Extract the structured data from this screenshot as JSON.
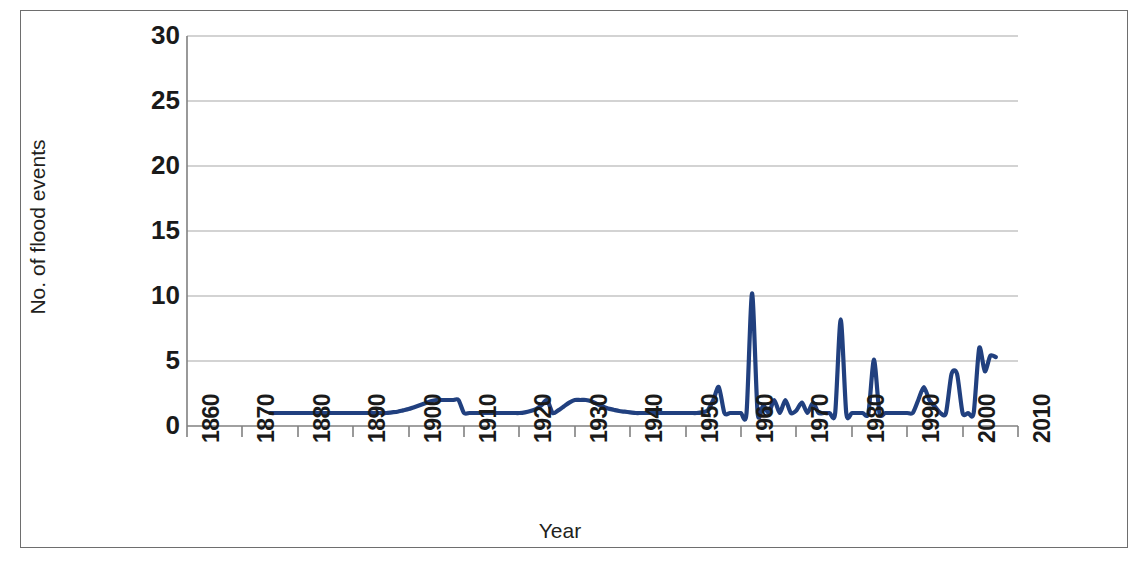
{
  "chart_data": {
    "type": "line",
    "title": "",
    "xlabel": "Year",
    "ylabel": "No. of flood events",
    "xlim": [
      1860,
      2010
    ],
    "ylim": [
      0,
      30
    ],
    "grid": "horizontal",
    "legend": "none",
    "line_color": "#21407f",
    "x_tick_labels": [
      "1860",
      "1870",
      "1880",
      "1890",
      "1900",
      "1910",
      "1920",
      "1930",
      "1940",
      "1950",
      "1960",
      "1970",
      "1980",
      "1990",
      "2000",
      "2010"
    ],
    "y_tick_labels": [
      "0",
      "5",
      "10",
      "15",
      "20",
      "25",
      "30"
    ],
    "series": [
      {
        "name": "No. of flood events",
        "x": [
          1875,
          1876,
          1877,
          1878,
          1879,
          1880,
          1881,
          1882,
          1883,
          1884,
          1885,
          1886,
          1887,
          1888,
          1889,
          1890,
          1891,
          1892,
          1893,
          1894,
          1895,
          1896,
          1897,
          1898,
          1899,
          1900,
          1901,
          1902,
          1903,
          1904,
          1905,
          1906,
          1907,
          1908,
          1909,
          1910,
          1911,
          1912,
          1913,
          1914,
          1915,
          1916,
          1917,
          1918,
          1919,
          1920,
          1921,
          1922,
          1923,
          1924,
          1925,
          1926,
          1927,
          1928,
          1929,
          1930,
          1931,
          1932,
          1933,
          1934,
          1935,
          1936,
          1937,
          1938,
          1939,
          1940,
          1941,
          1942,
          1943,
          1944,
          1945,
          1946,
          1947,
          1948,
          1949,
          1950,
          1951,
          1952,
          1953,
          1954,
          1955,
          1956,
          1957,
          1958,
          1959,
          1960,
          1961,
          1962,
          1963,
          1964,
          1965,
          1966,
          1967,
          1968,
          1969,
          1970,
          1971,
          1972,
          1973,
          1974,
          1975,
          1976,
          1977,
          1978,
          1979,
          1980,
          1981,
          1982,
          1983,
          1984,
          1985,
          1986,
          1987,
          1988,
          1989,
          1990,
          1991,
          1992,
          1993,
          1994,
          1995,
          1996,
          1997,
          1998,
          1999,
          2000,
          2001,
          2002,
          2003,
          2004,
          2005,
          2006
        ],
        "values": [
          1.0,
          1.0,
          1.0,
          1.0,
          1.0,
          1.0,
          1.0,
          1.0,
          1.0,
          1.0,
          1.0,
          1.0,
          1.0,
          1.0,
          1.0,
          1.0,
          1.0,
          1.0,
          1.0,
          1.0,
          1.0,
          1.0,
          1.05,
          1.1,
          1.2,
          1.3,
          1.45,
          1.6,
          1.75,
          1.9,
          2.0,
          2.0,
          2.0,
          2.0,
          2.0,
          1.0,
          1.0,
          1.0,
          1.0,
          1.0,
          1.0,
          1.0,
          1.0,
          1.0,
          1.0,
          1.0,
          1.05,
          1.15,
          1.3,
          1.6,
          2.0,
          1.0,
          1.2,
          1.5,
          1.8,
          2.0,
          2.0,
          2.0,
          1.9,
          1.7,
          1.5,
          1.35,
          1.25,
          1.15,
          1.1,
          1.05,
          1.0,
          1.0,
          1.0,
          1.0,
          1.0,
          1.0,
          1.0,
          1.0,
          1.0,
          1.0,
          1.0,
          1.0,
          1.05,
          1.2,
          2.0,
          3.0,
          1.0,
          1.0,
          1.0,
          1.0,
          1.0,
          10.2,
          1.0,
          1.6,
          1.0,
          2.0,
          1.0,
          2.0,
          1.0,
          1.2,
          1.8,
          1.0,
          1.8,
          1.0,
          1.0,
          1.0,
          1.0,
          8.2,
          1.0,
          1.0,
          1.0,
          1.0,
          1.0,
          5.1,
          1.0,
          1.0,
          1.0,
          1.0,
          1.0,
          1.0,
          1.0,
          2.0,
          3.0,
          2.0,
          1.5,
          1.0,
          1.0,
          4.0,
          4.0,
          1.0,
          1.0,
          1.0,
          6.0,
          4.2,
          5.4,
          5.3
        ]
      }
    ],
    "annotations": {
      "peak_1962": 10.2,
      "peak_1978": 8.2,
      "peak_1984": 5.1,
      "peak_2004": 6.0,
      "series_start_year": 1875,
      "series_end_year": 2006
    }
  },
  "figure": {
    "border_color": "#6e6e6e",
    "background": "#ffffff",
    "gridline_color": "#a8a8a8",
    "axis_color": "#808080",
    "tick_text_color": "#1a1a1a"
  }
}
